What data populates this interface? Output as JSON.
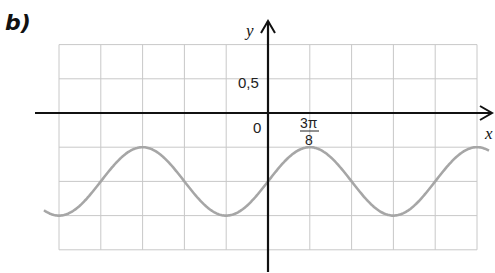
{
  "part_label": "b)",
  "colors": {
    "grid": "#c8c8c8",
    "axis": "#111111",
    "curve": "#a6a6a6"
  },
  "chart_data": {
    "type": "line",
    "title": "b)",
    "xlabel": "x",
    "ylabel": "y",
    "function": "y = 0.5·sin(4x/3) − 1",
    "tick_labels": {
      "origin": "0",
      "y_tick": "0,5",
      "x_tick_num": "3π",
      "x_tick_den": "8"
    },
    "x_unit_per_cell": "3π/8",
    "y_unit_per_cell": 0.5,
    "xlim_cells": [
      -5,
      5
    ],
    "ylim": [
      -2.0,
      1.0
    ],
    "grid": true,
    "series": [
      {
        "name": "curve",
        "x": [
          "-15π/8",
          "-3π/2",
          "-9π/8",
          "-3π/4",
          "-3π/8",
          "0",
          "3π/8",
          "3π/4",
          "9π/8",
          "3π/2",
          "15π/8"
        ],
        "values": [
          -1.5,
          -1.0,
          -0.5,
          -1.0,
          -1.5,
          -1.0,
          -0.5,
          -1.0,
          -1.5,
          -1.0,
          -0.5
        ]
      }
    ]
  }
}
